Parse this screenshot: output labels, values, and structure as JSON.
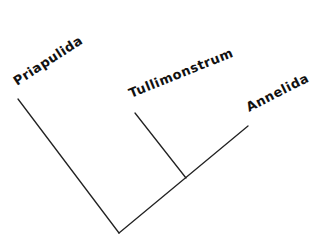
{
  "diagram": {
    "type": "cladogram",
    "taxa": [
      {
        "label": "Priapulida"
      },
      {
        "label": "Tullimonstrum"
      },
      {
        "label": "Annelida"
      }
    ],
    "line_color": "#222222"
  }
}
